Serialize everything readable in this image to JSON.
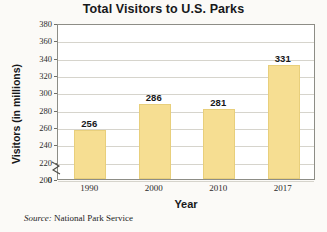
{
  "chart_data": {
    "type": "bar",
    "title": "Total Visitors to U.S. Parks",
    "xlabel": "Year",
    "ylabel": "Visitors (in millions)",
    "categories": [
      "1990",
      "2000",
      "2010",
      "2017"
    ],
    "values": [
      256,
      286,
      281,
      331
    ],
    "value_labels": [
      "256",
      "286",
      "281",
      "331"
    ],
    "ylim": [
      200,
      380
    ],
    "y_axis_break": true,
    "y_break_label": "0",
    "yticks": [
      380,
      360,
      340,
      320,
      300,
      280,
      260,
      240,
      220,
      200
    ],
    "ytick_labels": [
      "380",
      "360",
      "340",
      "320",
      "300",
      "280",
      "260",
      "240",
      "220",
      "200"
    ],
    "grid": true,
    "grid_axis": "y",
    "legend": false,
    "bar_color": "#f6de92",
    "bar_edge_color": "#e8cf7c",
    "plot_border_color": "#8d8d86",
    "gridline_color": "#d6d4cc",
    "background_color": "#fbfaf7"
  },
  "source": {
    "label": "Source:",
    "text": "National Park Service"
  }
}
